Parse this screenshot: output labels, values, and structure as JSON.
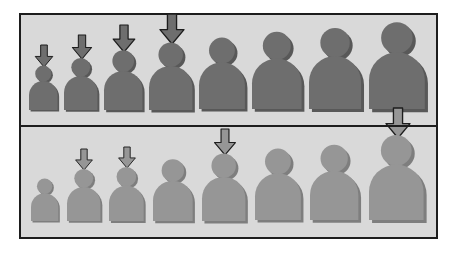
{
  "figure": {
    "background_color": "#ffffff",
    "panel_background_color": "#d9d9d9",
    "border_color": "#1d1d1d",
    "divider_color": "#1d1d1d"
  },
  "chart_data": {
    "type": "diagram",
    "title": "",
    "xlabel": "",
    "ylabel": "",
    "grid": false,
    "legend": "none",
    "panels": [
      {
        "name": "top-panel",
        "figure_color": "#6e6e6e",
        "figure_shadow_color": "#585858",
        "arrow_color": "#6e6e6e",
        "arrow_outline_color": "#1d1d1d",
        "categories": [
          "1",
          "2",
          "3",
          "4",
          "5",
          "6",
          "7",
          "8"
        ],
        "figure_heights": [
          46,
          54,
          62,
          70,
          74,
          80,
          84,
          90
        ],
        "arrow_present": [
          true,
          true,
          true,
          true,
          false,
          false,
          false,
          false
        ],
        "arrow_heights": [
          22,
          24,
          27,
          30,
          0,
          0,
          0,
          0
        ]
      },
      {
        "name": "bottom-panel",
        "figure_color": "#969696",
        "figure_shadow_color": "#7e7e7e",
        "arrow_color": "#969696",
        "arrow_outline_color": "#1d1d1d",
        "categories": [
          "1",
          "2",
          "3",
          "4",
          "5",
          "6",
          "7",
          "8"
        ],
        "figure_heights": [
          44,
          54,
          56,
          64,
          70,
          74,
          78,
          88
        ],
        "arrow_present": [
          false,
          true,
          true,
          false,
          true,
          false,
          false,
          true
        ],
        "arrow_heights": [
          0,
          21,
          21,
          0,
          26,
          0,
          0,
          30
        ]
      }
    ]
  }
}
